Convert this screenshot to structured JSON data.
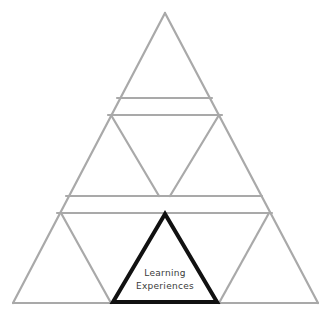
{
  "diagram": {
    "type": "pyramid-of-triangles",
    "highlighted_triangle": {
      "label_lines": [
        "Learning",
        "Experiences"
      ],
      "stroke_color": "#111111"
    },
    "line_color": "#a9a9a9",
    "background": "#ffffff",
    "tiers": 3
  }
}
